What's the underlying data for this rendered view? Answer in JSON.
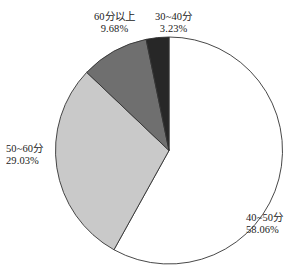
{
  "chart_data": {
    "type": "pie",
    "title": "",
    "subtitle": "",
    "xlabel": "",
    "ylabel": "",
    "legend_position": "none",
    "grid": false,
    "label_format": "name + percent",
    "start_angle_deg": 0,
    "direction": "clockwise",
    "categories": [
      "40~50分",
      "50~60分",
      "60分以上",
      "30~40分"
    ],
    "values": [
      58.06,
      29.03,
      9.68,
      3.23
    ],
    "value_labels": [
      "58.06%",
      "29.03%",
      "9.68%",
      "3.23%"
    ],
    "colors": [
      "#ffffff",
      "#c9c9c9",
      "#6f6f6f",
      "#272727"
    ],
    "slice_border_color": "#333333",
    "slices": [
      {
        "name": "40~50分",
        "percent_label": "58.06%",
        "value": 58.06,
        "color": "#ffffff",
        "start_deg": 0,
        "end_deg": 209.016
      },
      {
        "name": "50~60分",
        "percent_label": "29.03%",
        "value": 29.03,
        "color": "#c9c9c9",
        "start_deg": 209.016,
        "end_deg": 313.524
      },
      {
        "name": "60分以上",
        "percent_label": "9.68%",
        "value": 9.68,
        "color": "#6f6f6f",
        "start_deg": 313.524,
        "end_deg": 348.372
      },
      {
        "name": "30~40分",
        "percent_label": "3.23%",
        "value": 3.23,
        "color": "#272727",
        "start_deg": 348.372,
        "end_deg": 360
      }
    ]
  },
  "geometry": {
    "center_x": 169,
    "center_y": 150.5,
    "radius": 113.5
  }
}
